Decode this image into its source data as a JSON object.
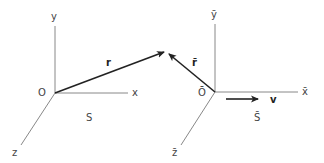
{
  "diagram": {
    "title": "",
    "frames": [
      {
        "name": "S",
        "label": "S",
        "origin_label": "O",
        "axes": {
          "x": "x",
          "y": "y",
          "z": "z"
        },
        "position_vector": "r"
      },
      {
        "name": "S-bar",
        "label": "S̄",
        "origin_label": "Ō",
        "axes": {
          "x": "x̄",
          "y": "ȳ",
          "z": "z̄"
        },
        "position_vector": "r̄",
        "velocity_vector": "v"
      }
    ],
    "colors": {
      "axis": "#888888",
      "vector": "#222222",
      "label": "#444444"
    }
  }
}
